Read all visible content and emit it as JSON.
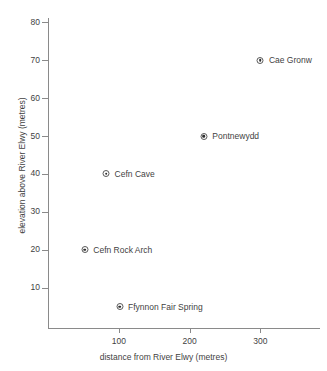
{
  "chart_data": {
    "type": "scatter",
    "title": "",
    "xlabel": "distance from River Elwy (metres)",
    "ylabel": "elevation above River Elwy (metres)",
    "xlim": [
      0,
      383
    ],
    "ylim": [
      0,
      86
    ],
    "xticks": [
      100,
      200,
      300
    ],
    "yticks": [
      10,
      20,
      30,
      40,
      50,
      60,
      70,
      80
    ],
    "xtick_labels": [
      "100",
      "200",
      "300"
    ],
    "ytick_labels": [
      "10",
      "20",
      "30",
      "40",
      "50",
      "60",
      "70",
      "80"
    ],
    "grid": false,
    "legend": "none",
    "marker": "circle-dot",
    "points": [
      {
        "label": "Cae Gronw",
        "x": 300,
        "y": 70
      },
      {
        "label": "Pontnewydd",
        "x": 220,
        "y": 50
      },
      {
        "label": "Cefn Cave",
        "x": 82,
        "y": 40
      },
      {
        "label": "Cefn Rock Arch",
        "x": 52,
        "y": 20
      },
      {
        "label": "Ffynnon Fair Spring",
        "x": 101,
        "y": 5
      }
    ]
  },
  "colors": {
    "axis": "#8a8a8a",
    "text": "#3f3f3f",
    "marker_stroke": "#5a5a5a",
    "marker_fill": "#2e2e2e",
    "background": "#ffffff"
  }
}
